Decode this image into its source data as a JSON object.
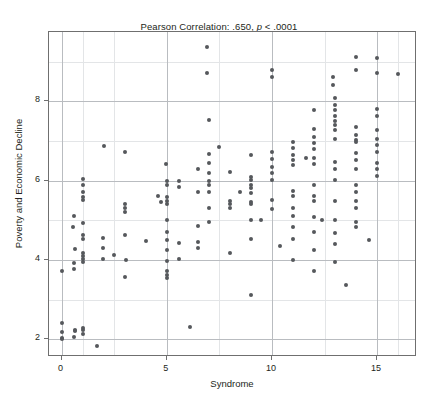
{
  "chart_data": {
    "type": "scatter",
    "title": "Pearson Correlation: .650, p < .0001",
    "title_prefix": "Pearson Correlation: .650, ",
    "title_italic": "p",
    "title_suffix": " < .0001",
    "xlabel": "Syndrome",
    "ylabel": "Poverty and Economic Decline",
    "xlim": [
      -0.6,
      16.9
    ],
    "ylim": [
      1.55,
      9.75
    ],
    "xticks": [
      0,
      5,
      10,
      15
    ],
    "xticklabels": [
      "0",
      "5",
      "10",
      "15"
    ],
    "yticks": [
      2,
      4,
      6,
      8
    ],
    "yticklabels": [
      "2",
      "4",
      "6",
      "8"
    ],
    "grid": true,
    "grid_major_x": [
      0,
      5,
      10,
      15
    ],
    "grid_major_y": [
      2,
      4,
      6,
      8
    ],
    "grid_minor_x": [
      1,
      2.5,
      7.5,
      12.5,
      16
    ],
    "grid_minor_y": [
      3,
      5,
      7,
      9
    ],
    "marker_color": "#55585c",
    "marker_size_px": 4,
    "frame_color": "#6f6f6f",
    "gridline_color": "#b9bcc0",
    "gridline_minor_color": "#e3e5e7",
    "background": "#ffffff",
    "n_points": 192,
    "points": [
      [
        0.0,
        3.72
      ],
      [
        0.0,
        2.42
      ],
      [
        0.0,
        2.18
      ],
      [
        0.0,
        2.02
      ],
      [
        0.0,
        2.0
      ],
      [
        0.55,
        4.82
      ],
      [
        0.6,
        5.1
      ],
      [
        0.62,
        4.28
      ],
      [
        0.6,
        3.92
      ],
      [
        0.6,
        3.78
      ],
      [
        0.65,
        2.22
      ],
      [
        0.62,
        2.2
      ],
      [
        0.6,
        2.05
      ],
      [
        1.0,
        6.05
      ],
      [
        1.0,
        5.9
      ],
      [
        1.0,
        5.72
      ],
      [
        1.0,
        5.6
      ],
      [
        1.0,
        5.5
      ],
      [
        1.0,
        4.92
      ],
      [
        1.0,
        4.62
      ],
      [
        1.0,
        4.52
      ],
      [
        1.0,
        4.18
      ],
      [
        1.0,
        4.1
      ],
      [
        1.0,
        4.02
      ],
      [
        1.0,
        3.95
      ],
      [
        1.0,
        2.28
      ],
      [
        1.0,
        2.22
      ],
      [
        1.0,
        2.12
      ],
      [
        1.7,
        1.82
      ],
      [
        1.95,
        4.55
      ],
      [
        1.95,
        4.3
      ],
      [
        1.95,
        4.02
      ],
      [
        2.0,
        6.88
      ],
      [
        2.5,
        4.12
      ],
      [
        3.0,
        6.72
      ],
      [
        3.0,
        5.42
      ],
      [
        3.0,
        5.3
      ],
      [
        3.0,
        5.22
      ],
      [
        3.0,
        4.62
      ],
      [
        3.05,
        4.0
      ],
      [
        3.0,
        3.58
      ],
      [
        4.0,
        4.48
      ],
      [
        4.6,
        5.62
      ],
      [
        4.7,
        5.45
      ],
      [
        4.95,
        6.42
      ],
      [
        5.0,
        6.0
      ],
      [
        5.0,
        5.9
      ],
      [
        5.0,
        5.6
      ],
      [
        5.0,
        5.48
      ],
      [
        5.0,
        5.42
      ],
      [
        5.0,
        5.0
      ],
      [
        5.0,
        4.7
      ],
      [
        5.0,
        4.5
      ],
      [
        5.0,
        4.25
      ],
      [
        5.0,
        3.98
      ],
      [
        5.0,
        3.72
      ],
      [
        5.0,
        3.62
      ],
      [
        5.0,
        3.55
      ],
      [
        5.6,
        5.98
      ],
      [
        5.6,
        5.85
      ],
      [
        5.6,
        4.42
      ],
      [
        5.6,
        4.02
      ],
      [
        6.1,
        2.3
      ],
      [
        6.5,
        6.3
      ],
      [
        6.5,
        5.72
      ],
      [
        6.5,
        4.85
      ],
      [
        6.5,
        4.45
      ],
      [
        6.5,
        4.3
      ],
      [
        6.9,
        9.38
      ],
      [
        6.9,
        8.72
      ],
      [
        7.0,
        7.52
      ],
      [
        7.0,
        6.68
      ],
      [
        7.0,
        6.45
      ],
      [
        7.0,
        6.2
      ],
      [
        7.0,
        6.0
      ],
      [
        7.0,
        5.88
      ],
      [
        7.0,
        5.72
      ],
      [
        7.0,
        5.32
      ],
      [
        7.0,
        4.95
      ],
      [
        7.5,
        6.85
      ],
      [
        8.0,
        6.22
      ],
      [
        8.0,
        5.48
      ],
      [
        8.0,
        5.42
      ],
      [
        8.0,
        5.3
      ],
      [
        8.0,
        4.18
      ],
      [
        8.5,
        5.72
      ],
      [
        9.0,
        6.65
      ],
      [
        9.0,
        6.1
      ],
      [
        9.0,
        6.02
      ],
      [
        9.0,
        5.9
      ],
      [
        9.0,
        5.82
      ],
      [
        9.0,
        5.7
      ],
      [
        9.0,
        5.45
      ],
      [
        9.0,
        5.4
      ],
      [
        9.0,
        5.0
      ],
      [
        9.0,
        4.52
      ],
      [
        9.0,
        3.12
      ],
      [
        9.5,
        5.0
      ],
      [
        10.0,
        8.78
      ],
      [
        10.0,
        8.62
      ],
      [
        10.0,
        6.72
      ],
      [
        10.0,
        6.55
      ],
      [
        10.0,
        6.35
      ],
      [
        10.0,
        6.2
      ],
      [
        10.0,
        6.02
      ],
      [
        10.0,
        5.52
      ],
      [
        10.0,
        5.28
      ],
      [
        10.4,
        4.35
      ],
      [
        11.0,
        6.98
      ],
      [
        11.0,
        6.82
      ],
      [
        11.0,
        6.65
      ],
      [
        11.0,
        6.52
      ],
      [
        11.0,
        6.4
      ],
      [
        11.0,
        5.75
      ],
      [
        11.0,
        5.62
      ],
      [
        11.0,
        5.32
      ],
      [
        11.0,
        5.1
      ],
      [
        11.0,
        4.82
      ],
      [
        11.0,
        4.52
      ],
      [
        11.0,
        4.0
      ],
      [
        11.6,
        6.58
      ],
      [
        12.0,
        7.78
      ],
      [
        12.0,
        7.3
      ],
      [
        12.0,
        7.1
      ],
      [
        12.0,
        6.95
      ],
      [
        12.0,
        6.8
      ],
      [
        12.0,
        6.58
      ],
      [
        12.0,
        6.42
      ],
      [
        12.0,
        5.88
      ],
      [
        12.0,
        5.62
      ],
      [
        12.0,
        5.48
      ],
      [
        12.0,
        5.08
      ],
      [
        12.0,
        4.7
      ],
      [
        12.0,
        4.25
      ],
      [
        12.0,
        3.72
      ],
      [
        12.4,
        5.02
      ],
      [
        12.9,
        8.62
      ],
      [
        12.9,
        8.42
      ],
      [
        13.0,
        8.08
      ],
      [
        13.0,
        7.9
      ],
      [
        13.0,
        7.78
      ],
      [
        13.0,
        7.62
      ],
      [
        13.0,
        7.5
      ],
      [
        13.0,
        7.4
      ],
      [
        13.0,
        7.28
      ],
      [
        13.0,
        7.05
      ],
      [
        13.0,
        6.48
      ],
      [
        13.0,
        6.3
      ],
      [
        13.0,
        6.02
      ],
      [
        13.0,
        5.48
      ],
      [
        13.0,
        5.02
      ],
      [
        13.0,
        4.68
      ],
      [
        13.0,
        4.4
      ],
      [
        13.0,
        3.95
      ],
      [
        13.5,
        3.38
      ],
      [
        14.0,
        9.12
      ],
      [
        14.0,
        8.78
      ],
      [
        14.0,
        7.35
      ],
      [
        14.0,
        7.15
      ],
      [
        14.0,
        7.02
      ],
      [
        14.0,
        6.98
      ],
      [
        14.0,
        6.7
      ],
      [
        14.0,
        6.52
      ],
      [
        14.0,
        6.3
      ],
      [
        14.0,
        5.88
      ],
      [
        14.0,
        5.72
      ],
      [
        14.0,
        5.48
      ],
      [
        14.0,
        5.3
      ],
      [
        14.0,
        4.95
      ],
      [
        14.0,
        4.82
      ],
      [
        14.6,
        4.5
      ],
      [
        15.0,
        9.1
      ],
      [
        15.0,
        8.72
      ],
      [
        15.0,
        7.82
      ],
      [
        15.0,
        7.62
      ],
      [
        15.0,
        7.28
      ],
      [
        15.0,
        7.05
      ],
      [
        15.0,
        6.9
      ],
      [
        15.0,
        6.72
      ],
      [
        15.0,
        6.45
      ],
      [
        15.0,
        6.3
      ],
      [
        15.0,
        6.12
      ],
      [
        16.0,
        8.68
      ]
    ]
  }
}
